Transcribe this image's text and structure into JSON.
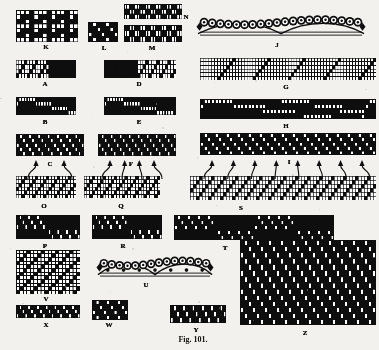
{
  "figure": {
    "caption": "Fig. 101.",
    "caption_x": 193,
    "caption_y": 335,
    "background_color": "#f2f1ee",
    "ink_color": "#111111",
    "paper_kind": "point-paper weave drafts",
    "width": 379,
    "height": 350
  },
  "labels": [
    {
      "id": "K",
      "text": "K",
      "x": 46,
      "y": 44
    },
    {
      "id": "L",
      "text": "L",
      "x": 104,
      "y": 45
    },
    {
      "id": "M",
      "text": "M",
      "x": 152,
      "y": 45
    },
    {
      "id": "N",
      "text": "N",
      "x": 186,
      "y": 14
    },
    {
      "id": "J",
      "text": "J",
      "x": 277,
      "y": 42
    },
    {
      "id": "A",
      "text": "A",
      "x": 45,
      "y": 81
    },
    {
      "id": "D",
      "text": "D",
      "x": 139,
      "y": 81
    },
    {
      "id": "G",
      "text": "G",
      "x": 286,
      "y": 84
    },
    {
      "id": "B",
      "text": "B",
      "x": 45,
      "y": 119
    },
    {
      "id": "E",
      "text": "E",
      "x": 139,
      "y": 119
    },
    {
      "id": "H",
      "text": "H",
      "x": 286,
      "y": 123
    },
    {
      "id": "C",
      "text": "C",
      "x": 50,
      "y": 161
    },
    {
      "id": "F",
      "text": "F",
      "x": 131,
      "y": 161
    },
    {
      "id": "I",
      "text": "I",
      "x": 289,
      "y": 159
    },
    {
      "id": "O",
      "text": "O",
      "x": 44,
      "y": 203
    },
    {
      "id": "Q",
      "text": "Q",
      "x": 121,
      "y": 203
    },
    {
      "id": "S",
      "text": "S",
      "x": 241,
      "y": 205
    },
    {
      "id": "P",
      "text": "P",
      "x": 45,
      "y": 243
    },
    {
      "id": "R",
      "text": "R",
      "x": 123,
      "y": 243
    },
    {
      "id": "T",
      "text": "T",
      "x": 225,
      "y": 245
    },
    {
      "id": "V",
      "text": "V",
      "x": 46,
      "y": 296
    },
    {
      "id": "U",
      "text": "U",
      "x": 146,
      "y": 282
    },
    {
      "id": "X",
      "text": "X",
      "x": 46,
      "y": 322
    },
    {
      "id": "W",
      "text": "W",
      "x": 109,
      "y": 322
    },
    {
      "id": "Y",
      "text": "Y",
      "x": 196,
      "y": 327
    },
    {
      "id": "Z",
      "text": "Z",
      "x": 305,
      "y": 330
    }
  ],
  "patterns": [
    {
      "id": "K",
      "x": 16,
      "y": 10,
      "w": 62,
      "h": 32,
      "cols": 14,
      "rows": 7,
      "style": "grid",
      "cells": "00010001000100 01110111011101 11011101110111 00010001000100 01110111011101 11011101110111 00010001000100"
    },
    {
      "id": "L",
      "x": 88,
      "y": 22,
      "w": 30,
      "h": 20,
      "cols": 7,
      "rows": 4,
      "style": "solid",
      "cells": "0100100 0010010 1001001 0100100"
    },
    {
      "id": "M",
      "x": 124,
      "y": 25,
      "w": 58,
      "h": 17,
      "cols": 22,
      "rows": 3,
      "style": "solid",
      "cells": "0011001100110011001100 1100110011001100110011 0011001100110011001100"
    },
    {
      "id": "N",
      "x": 124,
      "y": 4,
      "w": 58,
      "h": 15,
      "cols": 22,
      "rows": 3,
      "style": "solid",
      "cells": "1100110011001100110011 0011001100110011001100 1100110011001100110011"
    },
    {
      "id": "A",
      "x": 16,
      "y": 60,
      "w": 60,
      "h": 18,
      "cols": 22,
      "rows": 4,
      "style": "grid",
      "cells": "0001000100011111111111 0010001000101111111111 0100010001011111111111 1000100010001111111111"
    },
    {
      "id": "D",
      "x": 104,
      "y": 60,
      "w": 72,
      "h": 18,
      "cols": 26,
      "rows": 4,
      "style": "grid",
      "cells": "11111111111100010001000100 11111111111100100010001000 11111111111101000100010001 11111111111110001000100010"
    },
    {
      "id": "B",
      "x": 16,
      "y": 97,
      "w": 60,
      "h": 18,
      "cols": 22,
      "rows": 4,
      "style": "solid",
      "cells": "0111111000000000000000 1000000111111000000000 0000000000000111111000 0000000000000000000111"
    },
    {
      "id": "E",
      "x": 104,
      "y": 97,
      "w": 72,
      "h": 18,
      "cols": 26,
      "rows": 4,
      "style": "solid",
      "cells": "01111110000000000000000000 10000001111110000000000000 00000000000001111110000000 00000000000000000001111110"
    },
    {
      "id": "C",
      "x": 16,
      "y": 134,
      "w": 68,
      "h": 22,
      "cols": 22,
      "rows": 5,
      "style": "solid",
      "cells": "0100100100100100100100 0010010010010010010010 1001001001001001001001 0100100100100100100100 0010010010010010010010"
    },
    {
      "id": "F",
      "x": 98,
      "y": 134,
      "w": 78,
      "h": 22,
      "cols": 26,
      "rows": 5,
      "style": "solid",
      "cells": "01001001001001001001001001 00100100100100100100100100 10010010010010010010010010 01001001001001001001001001 00100100100100100100100100"
    },
    {
      "id": "G",
      "x": 200,
      "y": 58,
      "w": 176,
      "h": 22,
      "cols": 60,
      "rows": 6,
      "style": "grid",
      "cells": "000000000001000000000001000000000001000000000001000000000001 000000000010000000000010000000000010000000000010000000000010 000000000100000000000100000000000100000000000100000000000100 000000001000000000001000000000001000000000001000000000001000 000000010000000000010000000000010000000000010000000000010000 000000100000000000100000000000100000000000100000000000100000"
    },
    {
      "id": "H",
      "x": 200,
      "y": 99,
      "w": 176,
      "h": 20,
      "cols": 48,
      "rows": 4,
      "style": "solid",
      "cells": "011111111000000000000011111111000000000000000 100000000111111111000000000000011111111000000 000000000000000001111111110000000000001111111 000000000000000000000000000011111111000000001"
    },
    {
      "id": "I",
      "x": 200,
      "y": 133,
      "w": 176,
      "h": 22,
      "cols": 48,
      "rows": 5,
      "style": "solid",
      "cells": "010010010010010010010010010010010010010010010010 001001001001001001001001001001001001001001001001 100100100100100100100100100100100100100100100100 010010010010010010010010010010010010010010010010 001001001001001001001001001001001001001001001001"
    },
    {
      "id": "O",
      "x": 16,
      "y": 176,
      "w": 60,
      "h": 22,
      "cols": 22,
      "rows": 6,
      "style": "grid",
      "cells": "0001000100010001000100 0010001000100010001000 0100010001000100010001 1000100010001000100010 0001000100010001000100 0010001000100010001000"
    },
    {
      "id": "Q",
      "x": 84,
      "y": 176,
      "w": 76,
      "h": 22,
      "cols": 28,
      "rows": 6,
      "style": "grid",
      "cells": "0001000100010001000100010001 0010001000100010001000100010 0100010001000100010001000100 1000100010001000100010001000 0001000100010001000100010001 0010001000100010001000100010"
    },
    {
      "id": "S",
      "x": 190,
      "y": 176,
      "w": 186,
      "h": 24,
      "cols": 62,
      "rows": 6,
      "style": "grid",
      "cells": "00010001000100010001000100010001000100010001000100010001000100 00100010001000100010001000100010001000100010001000100010001000 01000100010001000100010001000100010001000100010001000100010001 10001000100010001000100010001000100010001000100010001000100010 00010001000100010001000100010001000100010001000100010001000100 00100010001000100010001000100010001000100010001000100010001000"
    },
    {
      "id": "P",
      "x": 16,
      "y": 215,
      "w": 64,
      "h": 24,
      "cols": 22,
      "rows": 5,
      "style": "solid",
      "cells": "0100100100000000000000 0010010010000000000000 1001001001000000000000 0000000000010010010010 0000000000001001001001"
    },
    {
      "id": "R",
      "x": 92,
      "y": 215,
      "w": 70,
      "h": 24,
      "cols": 24,
      "rows": 5,
      "style": "solid",
      "cells": "010010010010000000000000 001001001001000000000000 100100100100000000000000 000000000000010010010010 000000000000001001001001"
    },
    {
      "id": "T",
      "x": 174,
      "y": 215,
      "w": 160,
      "h": 25,
      "cols": 48,
      "rows": 5,
      "style": "solid",
      "cells": "010010010010000000000000010010010010000000000000 001001001001000000000000001001001001000000000000 100100100100000000000000100100100100000000000000 000000000000010010010010000000000000010010010010 000000000000001001001001000000000000001001001001"
    },
    {
      "id": "V",
      "x": 16,
      "y": 250,
      "w": 64,
      "h": 44,
      "cols": 18,
      "rows": 12,
      "style": "grid",
      "cells": "000100010001000100 001000100010001000 010001000100010001 100010001000100010 000100010001000100 001000100010001000 010001000100010001 100010001000100010 000100010001000100 001000100010001000 010001000100010001 100010001000100010"
    },
    {
      "id": "X",
      "x": 16,
      "y": 305,
      "w": 64,
      "h": 13,
      "cols": 22,
      "rows": 3,
      "style": "solid",
      "cells": "0100100100100100100100 0010010010010010010010 1001001001001001001001"
    },
    {
      "id": "W",
      "x": 92,
      "y": 300,
      "w": 36,
      "h": 20,
      "cols": 10,
      "rows": 4,
      "style": "solid",
      "cells": "0100100100 0010010010 1001001001 0100100100"
    },
    {
      "id": "Y",
      "x": 170,
      "y": 305,
      "w": 56,
      "h": 18,
      "cols": 18,
      "rows": 3,
      "style": "solid",
      "cells": "010010010010010010 001001001001001001 100100100100100100"
    },
    {
      "id": "Z",
      "x": 240,
      "y": 240,
      "w": 136,
      "h": 85,
      "cols": 34,
      "rows": 14,
      "style": "solid",
      "cells": "0100100100100100100100100100100100 0010010010010010010010010010010010 1001001001001001001001001001001001 0100100100100100100100100100100100 0010010010010010010010010010010010 1001001001001001001001001001001001 0100100100100100100100100100100100 0010010010010010010010010010010010 1001001001001001001001001001001001 0100100100100100100100100100100100 0010010010010010010010010010010010 1001001001001001001001001001001001 0100100100100100100100100100100100 0010010010010010010010010010010010"
    }
  ],
  "thread_illustrations": [
    {
      "id": "J",
      "label": "J",
      "x": 196,
      "y": 8,
      "w": 170,
      "h": 32,
      "loop_count": 20,
      "style": "loop-cross-section"
    },
    {
      "id": "U",
      "label": "U",
      "x": 96,
      "y": 250,
      "w": 118,
      "h": 30,
      "loop_count": 14,
      "style": "loop-cross-section-with-dots"
    }
  ],
  "arrow_groups": [
    {
      "id": "C-to-O",
      "from": "C",
      "to": "O",
      "count": 2,
      "x0": 30,
      "y0": 158,
      "x1": 70,
      "y1": 158,
      "tip_y": 160,
      "base_y": 176
    },
    {
      "id": "F-to-Q",
      "from": "F",
      "to": "Q",
      "count": 4,
      "x0": 104,
      "y0": 158,
      "x1": 160,
      "y1": 158,
      "tip_y": 160,
      "base_y": 176
    },
    {
      "id": "I-to-S",
      "from": "I",
      "to": "S",
      "count": 8,
      "x0": 206,
      "y0": 158,
      "x1": 368,
      "y1": 158,
      "tip_y": 160,
      "base_y": 176
    }
  ],
  "meta": {
    "has_grid_patterns": true,
    "has_solid_patterns": true,
    "label_font_weight": "bold"
  }
}
